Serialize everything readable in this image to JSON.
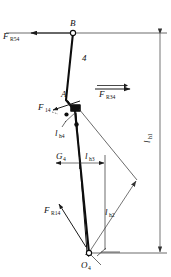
{
  "figure": {
    "type": "free-body-diagram",
    "background_color": "#ffffff",
    "stroke_color": "#0d0d0d"
  },
  "points": [
    {
      "id": "B",
      "label": "B",
      "sub": "",
      "x": 73,
      "y": 33,
      "kind": "pin-joint"
    },
    {
      "id": "A",
      "label": "A",
      "sub": "",
      "x": 66,
      "y": 100,
      "kind": "point"
    },
    {
      "id": "O4",
      "label": "O",
      "sub": "4",
      "x": 89,
      "y": 253,
      "kind": "ground-pivot"
    }
  ],
  "member": {
    "label": "4",
    "label_x": 84,
    "label_y": 58
  },
  "forces": [
    {
      "name": "F_R54",
      "base": "F",
      "sub": "R54",
      "label_x": 4,
      "label_y": 36,
      "arrow_from_x": 73,
      "arrow_from_y": 33,
      "arrow_to_x": 30,
      "arrow_to_y": 33,
      "direction": "left",
      "has_overbar": false
    },
    {
      "name": "F_R34",
      "base": "F",
      "sub": "R34",
      "label_x": 97,
      "label_y": 100,
      "arrow_from_x": 95,
      "arrow_from_y": 89,
      "arrow_to_x": 131,
      "arrow_to_y": 89,
      "direction": "right",
      "has_overbar": true
    },
    {
      "name": "F_14",
      "base": "F",
      "sub": "14",
      "label_x": 38,
      "label_y": 111,
      "arrow_from_x": 77,
      "arrow_from_y": 104,
      "arrow_to_x": 52,
      "arrow_to_y": 112,
      "direction": "upper-left",
      "has_overbar": false
    },
    {
      "name": "F_R14",
      "base": "F",
      "sub": "R14",
      "label_x": 44,
      "label_y": 212,
      "arrow_from_x": 86,
      "arrow_from_y": 247,
      "arrow_to_x": 58,
      "arrow_to_y": 203,
      "direction": "upper-left",
      "has_overbar": false
    },
    {
      "name": "G_4",
      "base": "G",
      "sub": "4",
      "label_x": 56,
      "label_y": 158,
      "arrow_from_x": 78,
      "arrow_from_y": 163,
      "arrow_to_x": 55,
      "arrow_to_y": 163,
      "direction": "left",
      "has_overbar": false
    }
  ],
  "dimensions": [
    {
      "name": "l_h1",
      "base": "l",
      "sub": "h1",
      "label_x": 150,
      "label_y": 140,
      "rotated": true,
      "from_x": 160,
      "from_y": 33,
      "to_x": 160,
      "to_y": 253
    },
    {
      "name": "l_h2",
      "base": "l",
      "sub": "h2",
      "label_x": 107,
      "label_y": 213,
      "rotated": false,
      "from_x": 89,
      "from_y": 253,
      "to_x": 137,
      "to_y": 180
    },
    {
      "name": "l_h3",
      "base": "l",
      "sub": "h3",
      "label_x": 84,
      "label_y": 158,
      "rotated": false,
      "from_x": 80,
      "from_y": 163,
      "to_x": 105,
      "to_y": 163
    },
    {
      "name": "l_h4",
      "base": "l",
      "sub": "h4",
      "label_x": 57,
      "label_y": 133,
      "rotated": false,
      "from_x": 64,
      "from_y": 124,
      "to_x": 76,
      "to_y": 111
    }
  ],
  "geometry": {
    "link_polyline": "73,33 66,100 75,110 89,253",
    "top_horizontal_y": 33,
    "bottom_horizontal_y": 253,
    "top_horizontal_x1": 6,
    "top_horizontal_x2": 167,
    "bottom_horizontal_x1": 86,
    "bottom_horizontal_x2": 167,
    "diag_from_block_x": 79,
    "diag_from_block_y": 109,
    "diag_to_x": 137,
    "diag_to_y": 180
  }
}
